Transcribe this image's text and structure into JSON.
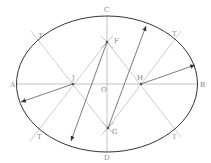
{
  "diagram": {
    "type": "geometric-construction",
    "colors": {
      "background": "#ffffff",
      "ellipse": "#333333",
      "construction": "#b8b8b8",
      "axis": "#aaaaaa",
      "arrow": "#444444",
      "label": "#8a8a8a"
    },
    "ellipse": {
      "cx": 107,
      "cy": 84,
      "rx": 90,
      "ry": 68
    },
    "points": {
      "A": {
        "x": 17,
        "y": 84,
        "label": "A"
      },
      "B": {
        "x": 198,
        "y": 84,
        "label": "B"
      },
      "C": {
        "x": 107,
        "y": 16,
        "label": "C"
      },
      "D": {
        "x": 107,
        "y": 152,
        "label": "D"
      },
      "O": {
        "x": 107,
        "y": 84,
        "label": "O"
      },
      "J": {
        "x": 73,
        "y": 84,
        "label": "J"
      },
      "H": {
        "x": 141,
        "y": 84,
        "label": "H"
      },
      "F": {
        "x": 107,
        "y": 42,
        "label": "F"
      },
      "G": {
        "x": 108,
        "y": 128,
        "label": "G"
      }
    },
    "tangent_points": [
      {
        "x": 38,
        "y": 41,
        "label": "T"
      },
      {
        "x": 174,
        "y": 41,
        "label": "T"
      },
      {
        "x": 38,
        "y": 127,
        "label": "T"
      },
      {
        "x": 174,
        "y": 127,
        "label": "T"
      }
    ],
    "labels": {
      "A": "A",
      "B": "B",
      "C": "C",
      "D": "D",
      "O": "O",
      "J": "J",
      "H": "H",
      "F": "F",
      "G": "G",
      "T1": "T",
      "T2": "T",
      "T3": "T",
      "T4": "T"
    }
  }
}
